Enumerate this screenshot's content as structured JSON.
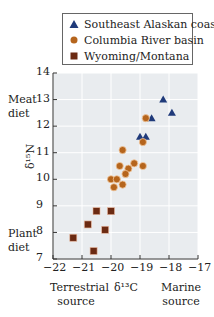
{
  "legend": {
    "items": [
      {
        "label": "Southeast Alaskan coast",
        "marker": "triangle",
        "color": "#1f3a7a"
      },
      {
        "label": "Columbia River basin",
        "marker": "circle",
        "color": "#b5651d"
      },
      {
        "label": "Wyoming/Montana",
        "marker": "square",
        "color": "#6b2a12"
      }
    ]
  },
  "axes": {
    "ylabel": "δ¹⁵N",
    "xlabel": "δ¹³C",
    "y_top_annotation": "Meat\ndiet",
    "y_bottom_annotation": "Plant\ndiet",
    "x_left_annotation": "Terrestrial\nsource",
    "x_right_annotation": "Marine\nsource",
    "yticks": [
      "14",
      "13",
      "12",
      "11",
      "10",
      "9",
      "8",
      "7"
    ],
    "xticks": [
      "−22",
      "−21",
      "−20",
      "−19",
      "−18",
      "−17"
    ]
  },
  "chart_data": {
    "type": "scatter",
    "title": "",
    "xlabel": "δ13C",
    "ylabel": "δ15N",
    "xlim": [
      -22,
      -17
    ],
    "ylim": [
      7,
      14
    ],
    "grid": true,
    "legend_position": "top",
    "annotations": [
      "Meat diet",
      "Plant diet",
      "Terrestrial source",
      "Marine source"
    ],
    "series": [
      {
        "name": "Southeast Alaskan coast",
        "marker": "triangle",
        "color": "#1f3a7a",
        "points": [
          [
            -18.2,
            13.0
          ],
          [
            -17.9,
            12.5
          ],
          [
            -18.6,
            12.3
          ],
          [
            -19.0,
            11.6
          ],
          [
            -18.8,
            11.6
          ]
        ]
      },
      {
        "name": "Columbia River basin",
        "marker": "circle",
        "color": "#b5651d",
        "points": [
          [
            -18.8,
            12.3
          ],
          [
            -18.9,
            11.4
          ],
          [
            -19.6,
            11.1
          ],
          [
            -19.2,
            10.6
          ],
          [
            -19.7,
            10.5
          ],
          [
            -18.9,
            10.5
          ],
          [
            -19.4,
            10.4
          ],
          [
            -19.5,
            10.2
          ],
          [
            -20.0,
            10.0
          ],
          [
            -19.8,
            10.0
          ],
          [
            -19.6,
            9.8
          ],
          [
            -19.9,
            9.7
          ]
        ]
      },
      {
        "name": "Wyoming/Montana",
        "marker": "square",
        "color": "#6b2a12",
        "points": [
          [
            -20.5,
            8.8
          ],
          [
            -20.0,
            8.8
          ],
          [
            -20.8,
            8.3
          ],
          [
            -20.2,
            8.1
          ],
          [
            -21.3,
            7.8
          ],
          [
            -20.6,
            7.3
          ]
        ]
      }
    ]
  }
}
